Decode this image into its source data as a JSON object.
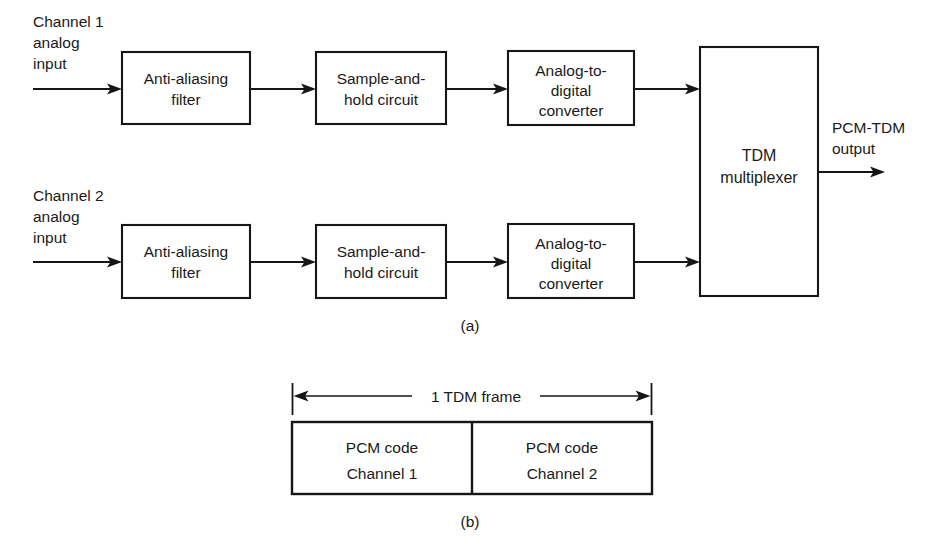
{
  "figure": {
    "background_color": "#ffffff",
    "line_color": "#161616",
    "text_color": "#1a1a1a"
  },
  "part_a": {
    "caption": "(a)",
    "channels": [
      {
        "input_label_line1": "Channel 1",
        "input_label_line2": "analog",
        "input_label_line3": "input",
        "blocks": [
          {
            "line1": "Anti-aliasing",
            "line2": "filter"
          },
          {
            "line1": "Sample-and-",
            "line2": "hold circuit"
          },
          {
            "line1": "Analog-to-",
            "line2": "digital",
            "line3": "converter"
          }
        ]
      },
      {
        "input_label_line1": "Channel 2",
        "input_label_line2": "analog",
        "input_label_line3": "input",
        "blocks": [
          {
            "line1": "Anti-aliasing",
            "line2": "filter"
          },
          {
            "line1": "Sample-and-",
            "line2": "hold circuit"
          },
          {
            "line1": "Analog-to-",
            "line2": "digital",
            "line3": "converter"
          }
        ]
      }
    ],
    "multiplexer": {
      "line1": "TDM",
      "line2": "multiplexer"
    },
    "output": {
      "line1": "PCM-TDM",
      "line2": "output"
    }
  },
  "part_b": {
    "caption": "(b)",
    "dimension_label": "1 TDM frame",
    "cells": [
      {
        "line1": "PCM code",
        "line2": "Channel 1"
      },
      {
        "line1": "PCM code",
        "line2": "Channel 2"
      }
    ]
  }
}
